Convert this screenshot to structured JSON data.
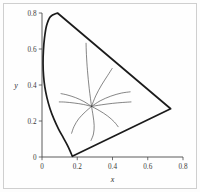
{
  "figure": {
    "background_color": "#fdfdfd",
    "frame_color": "#cfcfcf",
    "axis_color": "#4a4a4a",
    "gamut_color": "#1b1b1b",
    "curve_color": "#3b3b3b"
  },
  "chart_data": {
    "type": "line",
    "title": "",
    "subtitle": "",
    "xlabel": "x",
    "ylabel": "y",
    "xlim": [
      0,
      0.8
    ],
    "ylim": [
      0,
      0.8
    ],
    "grid": false,
    "legend": "none",
    "x_ticks": [
      0,
      0.2,
      0.4,
      0.6,
      0.8
    ],
    "x_tick_labels": [
      "0",
      "0.2",
      "0.4",
      "0.6",
      "0.8"
    ],
    "y_ticks": [
      0,
      0.2,
      0.4,
      0.6,
      0.8
    ],
    "y_tick_labels": [
      "0",
      "0.2",
      "0.4",
      "0.6",
      "0.8"
    ],
    "series": [
      {
        "name": "gamut-boundary",
        "kind": "closed-outline",
        "points": [
          [
            0.088,
            0.8
          ],
          [
            0.048,
            0.78
          ],
          [
            0.026,
            0.73
          ],
          [
            0.014,
            0.66
          ],
          [
            0.008,
            0.59
          ],
          [
            0.006,
            0.52
          ],
          [
            0.009,
            0.45
          ],
          [
            0.016,
            0.39
          ],
          [
            0.028,
            0.33
          ],
          [
            0.045,
            0.27
          ],
          [
            0.068,
            0.21
          ],
          [
            0.094,
            0.155
          ],
          [
            0.122,
            0.105
          ],
          [
            0.148,
            0.058
          ],
          [
            0.166,
            0.018
          ],
          [
            0.172,
            0.004
          ],
          [
            0.73,
            0.268
          ],
          [
            0.088,
            0.8
          ]
        ]
      },
      {
        "name": "radial-curve-1",
        "kind": "curve",
        "points": [
          [
            0.281,
            0.281
          ],
          [
            0.268,
            0.38
          ],
          [
            0.258,
            0.48
          ],
          [
            0.252,
            0.57
          ],
          [
            0.25,
            0.632
          ]
        ]
      },
      {
        "name": "radial-curve-2",
        "kind": "curve",
        "points": [
          [
            0.281,
            0.281
          ],
          [
            0.305,
            0.34
          ],
          [
            0.338,
            0.4
          ],
          [
            0.372,
            0.452
          ],
          [
            0.398,
            0.492
          ]
        ]
      },
      {
        "name": "radial-curve-3",
        "kind": "curve",
        "points": [
          [
            0.281,
            0.281
          ],
          [
            0.33,
            0.312
          ],
          [
            0.39,
            0.338
          ],
          [
            0.45,
            0.355
          ],
          [
            0.5,
            0.362
          ]
        ]
      },
      {
        "name": "radial-curve-4",
        "kind": "curve",
        "points": [
          [
            0.281,
            0.281
          ],
          [
            0.338,
            0.29
          ],
          [
            0.4,
            0.298
          ],
          [
            0.458,
            0.303
          ],
          [
            0.505,
            0.306
          ]
        ]
      },
      {
        "name": "radial-curve-5",
        "kind": "curve",
        "points": [
          [
            0.281,
            0.281
          ],
          [
            0.325,
            0.258
          ],
          [
            0.372,
            0.228
          ],
          [
            0.41,
            0.195
          ],
          [
            0.432,
            0.168
          ]
        ]
      },
      {
        "name": "radial-curve-6",
        "kind": "curve",
        "points": [
          [
            0.281,
            0.281
          ],
          [
            0.29,
            0.228
          ],
          [
            0.296,
            0.175
          ],
          [
            0.292,
            0.128
          ],
          [
            0.278,
            0.092
          ]
        ]
      },
      {
        "name": "radial-curve-7",
        "kind": "curve",
        "points": [
          [
            0.281,
            0.281
          ],
          [
            0.245,
            0.25
          ],
          [
            0.208,
            0.212
          ],
          [
            0.182,
            0.17
          ],
          [
            0.168,
            0.132
          ]
        ]
      },
      {
        "name": "radial-curve-8",
        "kind": "curve",
        "points": [
          [
            0.281,
            0.281
          ],
          [
            0.235,
            0.292
          ],
          [
            0.182,
            0.3
          ],
          [
            0.132,
            0.305
          ],
          [
            0.098,
            0.306
          ]
        ]
      },
      {
        "name": "radial-curve-9",
        "kind": "curve",
        "points": [
          [
            0.281,
            0.281
          ],
          [
            0.238,
            0.308
          ],
          [
            0.19,
            0.33
          ],
          [
            0.142,
            0.345
          ],
          [
            0.108,
            0.352
          ]
        ]
      }
    ]
  }
}
